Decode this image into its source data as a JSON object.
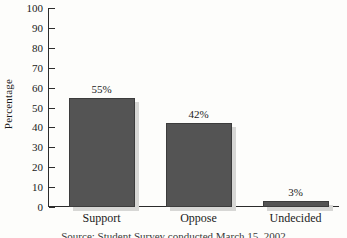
{
  "chart_data": {
    "type": "bar",
    "title": "",
    "xlabel": "",
    "ylabel": "Percentage",
    "categories": [
      "Support",
      "Oppose",
      "Undecided"
    ],
    "values": [
      55,
      42,
      3
    ],
    "data_labels": [
      "55%",
      "42%",
      "3%"
    ],
    "ylim": [
      0,
      100
    ],
    "ytick_step": 10,
    "yticks": [
      0,
      10,
      20,
      30,
      40,
      50,
      60,
      70,
      80,
      90,
      100
    ],
    "ytick_labels": [
      "0",
      "10",
      "20",
      "30",
      "40",
      "50",
      "60",
      "70",
      "80",
      "90",
      "100"
    ],
    "grid": false,
    "legend": false,
    "legend_position": "none",
    "bar_color": "#545454",
    "bar_edge_color": "#3c3c3c",
    "bar_shadow_color": "#d7d7d5",
    "axis_color": "#2b2b2b",
    "text_color": "#1a1a1a",
    "background_color": "#fdfdfb"
  },
  "caption": {
    "source_text": "Source: Student Survey conducted March 15, 2002"
  }
}
